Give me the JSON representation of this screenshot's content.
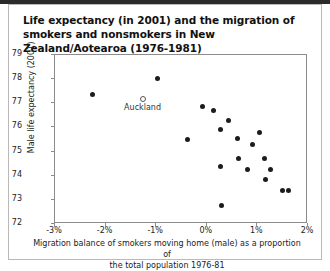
{
  "title": "Life expectancy (in 2001) and the migration of smokers and nonsmokers in New Zealand/Aotearoa (1976-1981)",
  "chart_data": {
    "type": "scatter",
    "title": "Life expectancy (in 2001) and the migration of smokers and nonsmokers in New Zealand/Aotearoa (1976-1981)",
    "xlabel": "Migration balance of smokers moving home  (male) as a proportion of the total population 1976-81",
    "ylabel": "Male life expectancy (2001)",
    "xlabel_line1": "Migration balance of smokers moving home  (male) as a proportion of",
    "xlabel_line2": "the total population 1976-81",
    "xlim": [
      -3,
      2
    ],
    "ylim": [
      72,
      79
    ],
    "grid": false,
    "legend": null,
    "xticks": [
      -3,
      -2,
      -1,
      0,
      1,
      2
    ],
    "xticklabels": [
      "-3%",
      "-2%",
      "-1%",
      "0%",
      "1%",
      "2%"
    ],
    "yticks": [
      72,
      73,
      74,
      75,
      76,
      77,
      78,
      79
    ],
    "yticklabels": [
      "72",
      "73",
      "74",
      "75",
      "76",
      "77",
      "78",
      "79"
    ],
    "series": [
      {
        "name": "regions",
        "marker": "filled-circle",
        "color": "#1c1c1c",
        "points": [
          {
            "x": -2.24,
            "y": 77.32
          },
          {
            "x": -0.96,
            "y": 77.98
          },
          {
            "x": -0.37,
            "y": 75.45
          },
          {
            "x": -0.06,
            "y": 76.83
          },
          {
            "x": 0.16,
            "y": 76.67
          },
          {
            "x": 0.29,
            "y": 74.33
          },
          {
            "x": 0.45,
            "y": 76.26
          },
          {
            "x": 0.29,
            "y": 75.88
          },
          {
            "x": 0.63,
            "y": 75.5
          },
          {
            "x": 0.92,
            "y": 75.26
          },
          {
            "x": 1.06,
            "y": 75.74
          },
          {
            "x": 0.65,
            "y": 74.67
          },
          {
            "x": 0.82,
            "y": 74.21
          },
          {
            "x": 1.16,
            "y": 74.67
          },
          {
            "x": 1.27,
            "y": 74.21
          },
          {
            "x": 1.18,
            "y": 73.82
          },
          {
            "x": 1.51,
            "y": 73.36
          },
          {
            "x": 1.63,
            "y": 73.36
          },
          {
            "x": 0.31,
            "y": 72.71
          }
        ]
      },
      {
        "name": "Auckland",
        "marker": "open-circle",
        "color": "#555555",
        "points": [
          {
            "x": -1.25,
            "y": 77.12,
            "label": "Auckland"
          }
        ]
      }
    ]
  }
}
